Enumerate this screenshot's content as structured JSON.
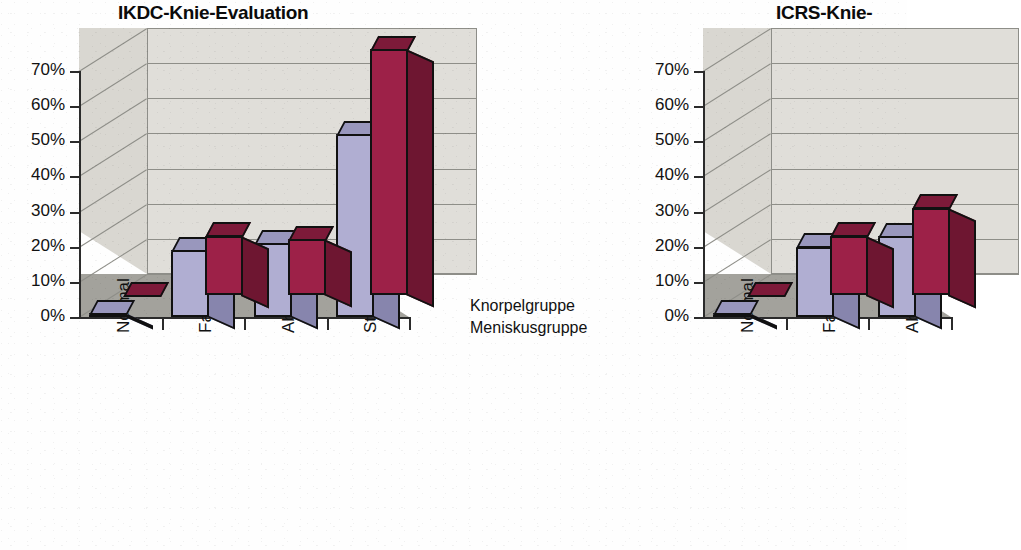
{
  "figure": {
    "background_color": "#fefefe",
    "text_color": "#111111"
  },
  "palette": {
    "series_knorpel": "#9d2148",
    "series_knorpel_top": "#7d1a39",
    "series_knorpel_side": "#6e1631",
    "series_meniskus": "#b0aed2",
    "series_meniskus_top": "#9997bd",
    "series_meniskus_side": "#8785ad",
    "wall_back": "#e0ded9",
    "wall_side": "#d9d7d1",
    "floor": "#a3a29c",
    "gridline": "#8e8e88",
    "axis": "#2b2b2b"
  },
  "charts": [
    {
      "id": "ikdc",
      "title": "IKDC-Knie-Evaluation",
      "truncated": false,
      "y_ticks": [
        "0%",
        "10%",
        "20%",
        "30%",
        "40%",
        "50%",
        "60%",
        "70%"
      ],
      "y_min": 0,
      "y_max": 70,
      "categories": [
        "Normal",
        "Fast normal",
        "Abnormal",
        "Stark abnormal"
      ],
      "series_labels": [
        "Knorpelgruppe",
        "Meniskusgruppe"
      ],
      "series": [
        {
          "name": "Knorpelgruppe",
          "color": "#9d2148",
          "values": [
            0,
            17,
            16,
            70
          ]
        },
        {
          "name": "Meniskusgruppe",
          "color": "#b0aed2",
          "values": [
            1,
            19,
            21,
            52
          ]
        }
      ]
    },
    {
      "id": "icrs",
      "title": "ICRS-Knie-",
      "truncated": true,
      "y_ticks": [
        "0%",
        "10%",
        "20%",
        "30%",
        "40%",
        "50%",
        "60%",
        "70%"
      ],
      "y_min": 0,
      "y_max": 70,
      "categories": [
        "Normal",
        "Fast normal",
        "Abnormal"
      ],
      "series_labels": [
        "Knorpelgruppe",
        "Meniskusgruppe"
      ],
      "series": [
        {
          "name": "Knorpelgruppe",
          "color": "#9d2148",
          "values": [
            0,
            17,
            25
          ]
        },
        {
          "name": "Meniskusgruppe",
          "color": "#b0aed2",
          "values": [
            1,
            20,
            23
          ]
        }
      ]
    }
  ],
  "chart_data": {
    "type": "bar",
    "xlabel": "",
    "ylabel": "",
    "ylim": [
      0,
      70
    ],
    "ytick_labels": [
      "0%",
      "10%",
      "20%",
      "30%",
      "40%",
      "50%",
      "60%",
      "70%"
    ],
    "grid": true,
    "legend": "depth-axis labels at right of plot",
    "panels": [
      {
        "title": "IKDC-Knie-Evaluation",
        "categories": [
          "Normal",
          "Fast normal",
          "Abnormal",
          "Stark abnormal"
        ],
        "series": [
          {
            "name": "Knorpelgruppe",
            "values": [
              0,
              17,
              16,
              70
            ]
          },
          {
            "name": "Meniskusgruppe",
            "values": [
              1,
              19,
              21,
              52
            ]
          }
        ]
      },
      {
        "title": "ICRS-Knie-",
        "note": "panel is cut off at the right edge of the image",
        "categories": [
          "Normal",
          "Fast normal",
          "Abnormal"
        ],
        "series": [
          {
            "name": "Knorpelgruppe",
            "values": [
              0,
              17,
              25
            ]
          },
          {
            "name": "Meniskusgruppe",
            "values": [
              1,
              20,
              23
            ]
          }
        ]
      }
    ]
  }
}
